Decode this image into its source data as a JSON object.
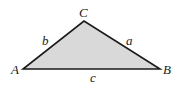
{
  "diagram": {
    "type": "triangle",
    "fill_color": "#d9d9d9",
    "stroke_color": "#1a1a1a",
    "vertices": {
      "A": {
        "label": "A",
        "x": 23,
        "y": 69
      },
      "B": {
        "label": "B",
        "x": 160,
        "y": 69
      },
      "C": {
        "label": "C",
        "x": 84,
        "y": 21
      }
    },
    "sides": {
      "a": {
        "label": "a",
        "between": [
          "B",
          "C"
        ]
      },
      "b": {
        "label": "b",
        "between": [
          "A",
          "C"
        ]
      },
      "c": {
        "label": "c",
        "between": [
          "A",
          "B"
        ]
      }
    }
  }
}
